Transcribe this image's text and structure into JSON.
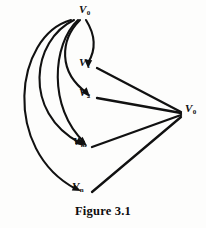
{
  "figure": {
    "caption": "Figure 3.1",
    "caption_x": 0,
    "caption_y": 204,
    "background": "#fdfdfc",
    "ink_color": "#111111",
    "type": "directed-graph-diagram"
  },
  "nodes": [
    {
      "id": "v0_top",
      "base": "V",
      "sub": "0",
      "label": "V0",
      "x": 79,
      "y": 4,
      "point_x": 88,
      "point_y": 17
    },
    {
      "id": "v1",
      "base": "V",
      "sub": "1",
      "label": "V1",
      "x": 79,
      "y": 57,
      "point_x": 88,
      "point_y": 70
    },
    {
      "id": "v2",
      "base": "V",
      "sub": "2",
      "label": "V2",
      "x": 79,
      "y": 87,
      "point_x": 88,
      "point_y": 100
    },
    {
      "id": "vm",
      "base": "V",
      "sub": "m",
      "label": "Vm",
      "x": 73,
      "y": 136,
      "point_x": 83,
      "point_y": 149
    },
    {
      "id": "vn",
      "base": "V",
      "sub": "n",
      "label": "Vn",
      "x": 72,
      "y": 181,
      "point_x": 82,
      "point_y": 194
    },
    {
      "id": "v0_right",
      "base": "V",
      "sub": "0",
      "label": "V0",
      "x": 185,
      "y": 103,
      "point_x": 183,
      "point_y": 113
    }
  ],
  "edges": [
    {
      "id": "e-v0-v1",
      "from": "v0_top",
      "to": "v1",
      "style": "curve",
      "arrow": true
    },
    {
      "id": "e-v0-v2",
      "from": "v0_top",
      "to": "v2",
      "style": "curve",
      "arrow": true
    },
    {
      "id": "e-v0-vm",
      "from": "v0_top",
      "to": "vm",
      "style": "curve",
      "arrow": true
    },
    {
      "id": "e-v0-vm2",
      "from": "v0_top",
      "to": "vm",
      "style": "curve",
      "arrow": true
    },
    {
      "id": "e-v0-vn",
      "from": "v0_top",
      "to": "vn",
      "style": "curve",
      "arrow": true
    },
    {
      "id": "e-v1-v0r",
      "from": "v1",
      "to": "v0_right",
      "style": "straight",
      "arrow": false
    },
    {
      "id": "e-v2-v0r",
      "from": "v2",
      "to": "v0_right",
      "style": "straight",
      "arrow": false
    },
    {
      "id": "e-vm-v0r",
      "from": "vm",
      "to": "v0_right",
      "style": "straight",
      "arrow": false
    },
    {
      "id": "e-vn-v0r",
      "from": "vn",
      "to": "v0_right",
      "style": "straight",
      "arrow": false
    }
  ]
}
